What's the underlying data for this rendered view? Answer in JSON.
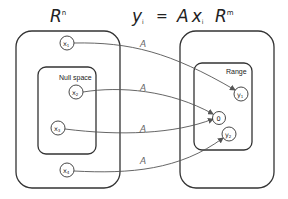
{
  "title": {
    "domain_space": {
      "base": "R",
      "sup": "n"
    },
    "equation": {
      "lhs": "y",
      "lhs_sub": "i",
      "op": "=",
      "A": "A",
      "x": "x",
      "x_sub": "i"
    },
    "codomain_space": {
      "base": "R",
      "sup": "m"
    }
  },
  "domain": {
    "inner_label": "Null space",
    "nodes": [
      {
        "base": "x",
        "sub": "1"
      },
      {
        "base": "x",
        "sub": "2"
      },
      {
        "base": "x",
        "sub": "3"
      },
      {
        "base": "x",
        "sub": "4"
      }
    ]
  },
  "codomain": {
    "inner_label": "Range",
    "nodes": [
      {
        "base": "y",
        "sub": "1"
      },
      {
        "base": "0",
        "sub": ""
      },
      {
        "base": "y",
        "sub": "2"
      }
    ]
  },
  "mappings": [
    {
      "from": "x1",
      "to": "y1",
      "label": "A"
    },
    {
      "from": "x2",
      "to": "0",
      "label": "A"
    },
    {
      "from": "x3",
      "to": "0",
      "label": "A"
    },
    {
      "from": "x4",
      "to": "y2",
      "label": "A"
    }
  ],
  "colors": {
    "stroke": "#333333",
    "arrow": "#555555",
    "label": "#666666"
  }
}
